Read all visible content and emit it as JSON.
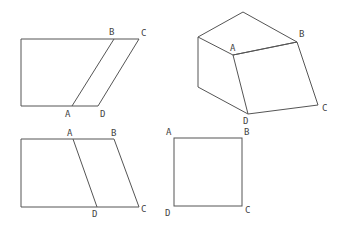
{
  "figures": [
    {
      "id": "parallelogram-top",
      "labels": {
        "A": "A",
        "B": "B",
        "C": "C",
        "D": "D"
      }
    },
    {
      "id": "prism-3d",
      "labels": {
        "A": "A",
        "B": "B",
        "C": "C",
        "D": "D"
      }
    },
    {
      "id": "parallelogram-bottom",
      "labels": {
        "A": "A",
        "B": "B",
        "C": "C",
        "D": "D"
      }
    },
    {
      "id": "square",
      "labels": {
        "A": "A",
        "B": "B",
        "C": "C",
        "D": "D"
      }
    }
  ],
  "colors": {
    "line": "#555555",
    "label": "#444444",
    "background": "#ffffff"
  }
}
